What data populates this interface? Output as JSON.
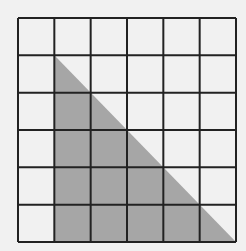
{
  "diagram": {
    "type": "grid-with-shaded-triangle",
    "grid": {
      "rows": 6,
      "cols": 6,
      "x": 18,
      "y": 18,
      "width": 218,
      "height": 224,
      "line_color": "#222222",
      "line_width": 2
    },
    "shaded_triangle": {
      "description": "Right triangle spanning columns 2-6 and rows 2-6; right angle at bottom-left of column 2",
      "vertices_cells": [
        [
          1,
          1
        ],
        [
          1,
          6
        ],
        [
          6,
          6
        ]
      ],
      "fill_color": "#a6a6a6"
    },
    "background_color": "#f1f1f1"
  }
}
